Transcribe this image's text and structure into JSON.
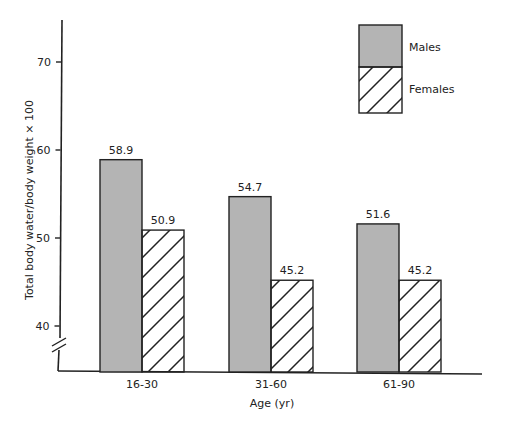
{
  "chart_data": {
    "type": "bar",
    "title": "",
    "xlabel": "Age (yr)",
    "ylabel": "Total body water/body weight × 100",
    "categories": [
      "16-30",
      "31-60",
      "61-90"
    ],
    "series": [
      {
        "name": "Males",
        "values": [
          58.9,
          54.7,
          51.6
        ],
        "labels": [
          "58.9",
          "54.7",
          "51.6"
        ],
        "fill": "#b4b4b4",
        "pattern": "solid gray"
      },
      {
        "name": "Females",
        "values": [
          50.9,
          45.2,
          45.2
        ],
        "labels": [
          "50.9",
          "45.2",
          "45.2"
        ],
        "fill": "#ffffff",
        "pattern": "diagonal hatch"
      }
    ],
    "yticks": [
      40,
      50,
      60,
      70
    ],
    "ytick_labels": [
      "40",
      "50",
      "60",
      "70"
    ],
    "ylim": [
      35,
      75
    ],
    "axis_break": true,
    "grid": false,
    "legend_position": "top-right"
  },
  "legend": {
    "males_label": "Males",
    "females_label": "Females"
  },
  "colors": {
    "male_fill": "#b4b4b4",
    "female_fill": "#ffffff",
    "stroke": "#222222"
  }
}
